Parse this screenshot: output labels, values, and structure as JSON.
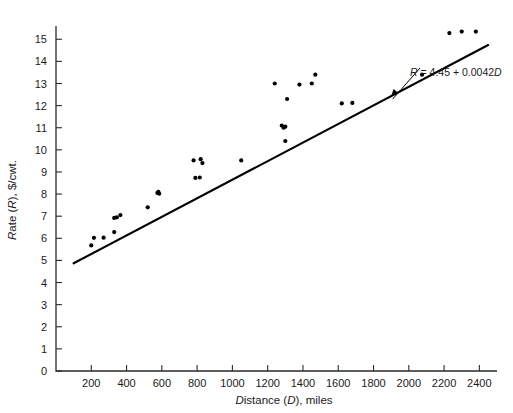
{
  "chart_data": {
    "type": "scatter",
    "title": "",
    "xlabel": "Distance (D), miles",
    "ylabel": "Rate (R), $/cwt.",
    "xlim": [
      0,
      2500
    ],
    "ylim": [
      0,
      15.6
    ],
    "grid": false,
    "legend": null,
    "x_ticks": [
      200,
      400,
      600,
      800,
      1000,
      1200,
      1400,
      1600,
      1800,
      2000,
      2200,
      2400
    ],
    "x_tick_labels": [
      "200",
      "400",
      "600",
      "800",
      "1000",
      "1200",
      "1400",
      "1600",
      "1800",
      "2000",
      "2200",
      "2400"
    ],
    "y_ticks": [
      0,
      1,
      2,
      3,
      4,
      5,
      6,
      7,
      8,
      9,
      10,
      11,
      12,
      13,
      14,
      15
    ],
    "y_tick_labels": [
      "0",
      "1",
      "2",
      "3",
      "4",
      "5",
      "6",
      "7",
      "8",
      "9",
      "10",
      "11",
      "12",
      "13",
      "14",
      "15"
    ],
    "points": [
      [
        200,
        5.68
      ],
      [
        215,
        6.02
      ],
      [
        270,
        6.03
      ],
      [
        330,
        6.28
      ],
      [
        330,
        6.92
      ],
      [
        345,
        6.95
      ],
      [
        365,
        7.05
      ],
      [
        520,
        7.4
      ],
      [
        575,
        8.05
      ],
      [
        580,
        8.1
      ],
      [
        585,
        8.02
      ],
      [
        780,
        9.52
      ],
      [
        790,
        8.73
      ],
      [
        815,
        8.75
      ],
      [
        820,
        9.58
      ],
      [
        830,
        9.4
      ],
      [
        1050,
        9.52
      ],
      [
        1240,
        13.0
      ],
      [
        1280,
        11.1
      ],
      [
        1290,
        11.0
      ],
      [
        1300,
        11.05
      ],
      [
        1300,
        10.4
      ],
      [
        1310,
        12.3
      ],
      [
        1380,
        12.95
      ],
      [
        1450,
        13.0
      ],
      [
        1470,
        13.4
      ],
      [
        1620,
        12.1
      ],
      [
        1680,
        12.12
      ],
      [
        2075,
        13.4
      ],
      [
        2230,
        15.28
      ],
      [
        2300,
        15.35
      ],
      [
        2380,
        15.35
      ]
    ],
    "fit_line": {
      "equation_label": "R = 4.45 + 0.0042D",
      "intercept": 4.45,
      "slope": 0.0042,
      "x_start": 100,
      "x_end": 2450
    },
    "annotation": {
      "text": "R = 4.45 + 0.0042D",
      "points_to_x": 1900,
      "points_to_y": 12.43
    }
  }
}
